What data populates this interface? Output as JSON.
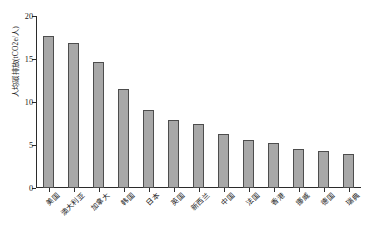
{
  "chart_data": {
    "type": "bar",
    "title": "",
    "xlabel": "",
    "ylabel": "人均碳排放(tCO2e/人)",
    "ylim": [
      0,
      20
    ],
    "yticks": [
      0,
      5,
      10,
      15,
      20
    ],
    "grid": false,
    "legend": "none",
    "orientation": "vertical",
    "sort": "descending",
    "bar_color": "#a8a8a8",
    "bar_edge_color": "#4d4d4d",
    "axis_color": "#2b2b2b",
    "categories": [
      "美国",
      "澳大利亚",
      "加拿大",
      "韩国",
      "日本",
      "英国",
      "新西兰",
      "中国",
      "法国",
      "香港",
      "挪威",
      "德国",
      "瑞典"
    ],
    "values": [
      17.7,
      16.9,
      14.7,
      11.5,
      9.1,
      7.9,
      7.4,
      6.3,
      5.6,
      5.2,
      4.5,
      4.3,
      3.9
    ]
  }
}
